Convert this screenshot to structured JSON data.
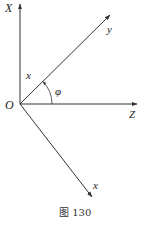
{
  "diagram": {
    "axes": {
      "X": "X",
      "Z": "Z",
      "y": "y",
      "x_lower": "x"
    },
    "origin_label": "O",
    "segment_label": "x",
    "angle_label": "φ",
    "caption": "图 130",
    "colors": {
      "line": "#333333",
      "background": "#ffffff"
    }
  }
}
